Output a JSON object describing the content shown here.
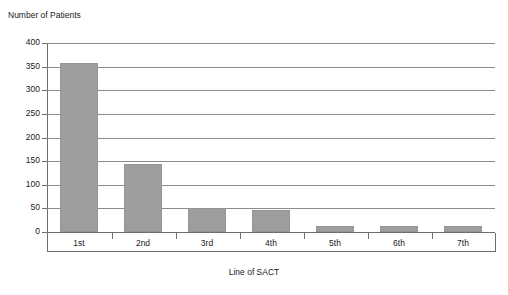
{
  "chart_data": {
    "type": "bar",
    "title": "",
    "ylabel": "Number of Patients",
    "xlabel": "Line of SACT",
    "categories": [
      "1st",
      "2nd",
      "3rd",
      "4th",
      "5th",
      "6th",
      "7th"
    ],
    "values": [
      358,
      145,
      51,
      47,
      13,
      13,
      12
    ],
    "ylim": [
      0,
      400
    ],
    "yticks": [
      0,
      50,
      100,
      150,
      200,
      250,
      300,
      350,
      400
    ],
    "ytick_labels": [
      "0",
      "50",
      "100",
      "150",
      "200",
      "250",
      "300",
      "350",
      "400"
    ],
    "grid": true,
    "legend": false,
    "series": [
      {
        "name": "Number of Patients",
        "values": [
          358,
          145,
          51,
          47,
          13,
          13,
          12
        ],
        "color": "#9e9e9e"
      }
    ]
  },
  "style": {
    "bar_fill": "#9e9e9e",
    "bar_stroke": "#949494",
    "grid_color": "#8c8c8c",
    "axis_color": "#6e6e6e",
    "text_color": "#1a1a1a",
    "background": "#ffffff"
  }
}
